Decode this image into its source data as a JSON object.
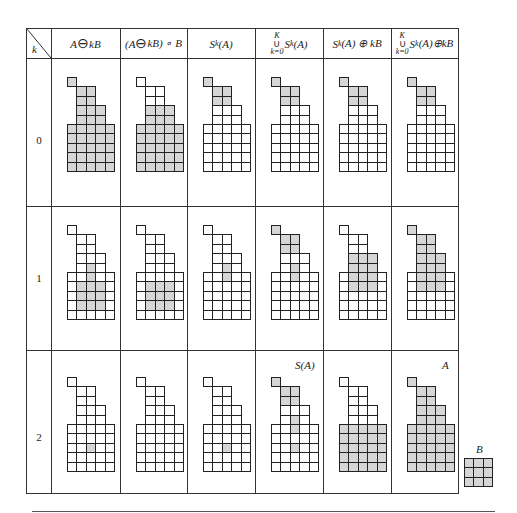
{
  "table": {
    "corner_label": "k",
    "headers": [
      {
        "id": "erosion",
        "parts": [
          "A ",
          "⊖",
          " kB"
        ]
      },
      {
        "id": "opening",
        "parts": [
          "(A ",
          "⊖",
          " kB) ∘ B"
        ]
      },
      {
        "id": "skeleton_subset",
        "text": "S",
        "sub": "k",
        "after": "(A)"
      },
      {
        "id": "union_subsets",
        "top": "K",
        "bottom": "k=0",
        "text": "S",
        "sub": "k",
        "after": "(A)"
      },
      {
        "id": "subset_dilated",
        "text": "S",
        "sub": "k",
        "after": "(A) ⊕ kB"
      },
      {
        "id": "union_dilated",
        "top": "K",
        "bottom": "k=0",
        "text": "S",
        "sub": "k",
        "after": "(A)⊕kB"
      }
    ],
    "rows": [
      {
        "k": "0"
      },
      {
        "k": "1"
      },
      {
        "k": "2"
      }
    ],
    "annotations": {
      "skeleton": "S(A)",
      "original": "A",
      "structuring_element": "B"
    }
  },
  "shape_A_cells": [
    [
      0,
      0
    ],
    [
      1,
      1
    ],
    [
      1,
      2
    ],
    [
      2,
      1
    ],
    [
      2,
      2
    ],
    [
      3,
      1
    ],
    [
      3,
      2
    ],
    [
      3,
      3
    ],
    [
      4,
      1
    ],
    [
      4,
      2
    ],
    [
      4,
      3
    ],
    [
      5,
      0
    ],
    [
      5,
      1
    ],
    [
      5,
      2
    ],
    [
      5,
      3
    ],
    [
      5,
      4
    ],
    [
      6,
      0
    ],
    [
      6,
      1
    ],
    [
      6,
      2
    ],
    [
      6,
      3
    ],
    [
      6,
      4
    ],
    [
      7,
      0
    ],
    [
      7,
      1
    ],
    [
      7,
      2
    ],
    [
      7,
      3
    ],
    [
      7,
      4
    ],
    [
      8,
      0
    ],
    [
      8,
      1
    ],
    [
      8,
      2
    ],
    [
      8,
      3
    ],
    [
      8,
      4
    ],
    [
      9,
      0
    ],
    [
      9,
      1
    ],
    [
      9,
      2
    ],
    [
      9,
      3
    ],
    [
      9,
      4
    ]
  ],
  "shaded": {
    "k0": [
      "ALL",
      [
        [
          3,
          1
        ],
        [
          3,
          2
        ],
        [
          3,
          3
        ],
        [
          4,
          1
        ],
        [
          4,
          2
        ],
        [
          4,
          3
        ],
        [
          5,
          0
        ],
        [
          5,
          1
        ],
        [
          5,
          2
        ],
        [
          5,
          3
        ],
        [
          5,
          4
        ],
        [
          6,
          0
        ],
        [
          6,
          1
        ],
        [
          6,
          2
        ],
        [
          6,
          3
        ],
        [
          6,
          4
        ],
        [
          7,
          0
        ],
        [
          7,
          1
        ],
        [
          7,
          2
        ],
        [
          7,
          3
        ],
        [
          7,
          4
        ],
        [
          8,
          0
        ],
        [
          8,
          1
        ],
        [
          8,
          2
        ],
        [
          8,
          3
        ],
        [
          8,
          4
        ],
        [
          9,
          0
        ],
        [
          9,
          1
        ],
        [
          9,
          2
        ],
        [
          9,
          3
        ],
        [
          9,
          4
        ]
      ],
      [
        [
          0,
          0
        ],
        [
          1,
          1
        ],
        [
          1,
          2
        ],
        [
          2,
          1
        ],
        [
          2,
          2
        ]
      ],
      [
        [
          0,
          0
        ],
        [
          1,
          1
        ],
        [
          1,
          2
        ],
        [
          2,
          1
        ],
        [
          2,
          2
        ]
      ],
      [
        [
          0,
          0
        ],
        [
          1,
          1
        ],
        [
          1,
          2
        ],
        [
          2,
          1
        ],
        [
          2,
          2
        ]
      ],
      [
        [
          0,
          0
        ],
        [
          1,
          1
        ],
        [
          1,
          2
        ],
        [
          2,
          1
        ],
        [
          2,
          2
        ]
      ]
    ],
    "k1": [
      [
        [
          4,
          2
        ],
        [
          5,
          2
        ],
        [
          6,
          1
        ],
        [
          6,
          2
        ],
        [
          6,
          3
        ],
        [
          7,
          1
        ],
        [
          7,
          2
        ],
        [
          7,
          3
        ],
        [
          8,
          1
        ],
        [
          8,
          2
        ],
        [
          8,
          3
        ]
      ],
      [
        [
          6,
          1
        ],
        [
          6,
          2
        ],
        [
          6,
          3
        ],
        [
          7,
          1
        ],
        [
          7,
          2
        ],
        [
          7,
          3
        ],
        [
          8,
          1
        ],
        [
          8,
          2
        ],
        [
          8,
          3
        ]
      ],
      [
        [
          4,
          2
        ],
        [
          5,
          2
        ]
      ],
      [
        [
          0,
          0
        ],
        [
          1,
          1
        ],
        [
          1,
          2
        ],
        [
          2,
          1
        ],
        [
          2,
          2
        ],
        [
          4,
          2
        ],
        [
          5,
          2
        ]
      ],
      [
        [
          3,
          1
        ],
        [
          3,
          2
        ],
        [
          3,
          3
        ],
        [
          4,
          1
        ],
        [
          4,
          2
        ],
        [
          4,
          3
        ],
        [
          5,
          1
        ],
        [
          5,
          2
        ],
        [
          5,
          3
        ],
        [
          6,
          1
        ],
        [
          6,
          2
        ],
        [
          6,
          3
        ]
      ],
      [
        [
          0,
          0
        ],
        [
          1,
          1
        ],
        [
          1,
          2
        ],
        [
          2,
          1
        ],
        [
          2,
          2
        ],
        [
          3,
          1
        ],
        [
          3,
          2
        ],
        [
          3,
          3
        ],
        [
          4,
          1
        ],
        [
          4,
          2
        ],
        [
          4,
          3
        ],
        [
          5,
          1
        ],
        [
          5,
          2
        ],
        [
          5,
          3
        ],
        [
          6,
          1
        ],
        [
          6,
          2
        ],
        [
          6,
          3
        ]
      ]
    ],
    "k2": [
      [
        [
          7,
          2
        ]
      ],
      [],
      [
        [
          7,
          2
        ]
      ],
      [
        [
          0,
          0
        ],
        [
          1,
          1
        ],
        [
          1,
          2
        ],
        [
          2,
          1
        ],
        [
          2,
          2
        ],
        [
          4,
          2
        ],
        [
          5,
          2
        ],
        [
          7,
          2
        ]
      ],
      [
        [
          5,
          0
        ],
        [
          5,
          1
        ],
        [
          5,
          2
        ],
        [
          5,
          3
        ],
        [
          5,
          4
        ],
        [
          6,
          0
        ],
        [
          6,
          1
        ],
        [
          6,
          2
        ],
        [
          6,
          3
        ],
        [
          6,
          4
        ],
        [
          7,
          0
        ],
        [
          7,
          1
        ],
        [
          7,
          2
        ],
        [
          7,
          3
        ],
        [
          7,
          4
        ],
        [
          8,
          0
        ],
        [
          8,
          1
        ],
        [
          8,
          2
        ],
        [
          8,
          3
        ],
        [
          8,
          4
        ],
        [
          9,
          0
        ],
        [
          9,
          1
        ],
        [
          9,
          2
        ],
        [
          9,
          3
        ],
        [
          9,
          4
        ]
      ],
      "ALL"
    ]
  },
  "colors": {
    "shade": "#d6d6d6",
    "line": "#222222"
  }
}
